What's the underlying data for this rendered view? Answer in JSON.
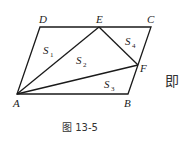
{
  "figure": {
    "caption": "图 13-5",
    "side_text": "即",
    "points": {
      "A": {
        "label": "A",
        "x": 17,
        "y": 94
      },
      "B": {
        "label": "B",
        "x": 128,
        "y": 94
      },
      "C": {
        "label": "C",
        "x": 151,
        "y": 27
      },
      "D": {
        "label": "D",
        "x": 40,
        "y": 27
      },
      "E": {
        "label": "E",
        "x": 99,
        "y": 27
      },
      "F": {
        "label": "F",
        "x": 138,
        "y": 65
      }
    },
    "regions": [
      {
        "label": "S",
        "sub": "1"
      },
      {
        "label": "S",
        "sub": "2"
      },
      {
        "label": "S",
        "sub": "3"
      },
      {
        "label": "S",
        "sub": "4"
      }
    ]
  }
}
